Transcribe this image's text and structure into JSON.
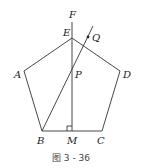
{
  "figure": {
    "caption": "图 3 - 36",
    "labels": {
      "A": "A",
      "B": "B",
      "C": "C",
      "D": "D",
      "E": "E",
      "F": "F",
      "M": "M",
      "P": "P",
      "Q": "Q"
    },
    "stroke_color": "#333333"
  }
}
